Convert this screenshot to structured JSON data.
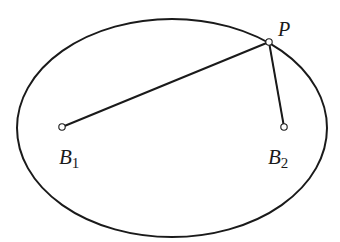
{
  "diagram": {
    "type": "ellipse-with-focal-segments",
    "background": "#ffffff",
    "stroke_color": "#1a1a1a",
    "ellipse": {
      "cx": 172,
      "cy": 128,
      "rx": 155,
      "ry": 109
    },
    "points": [
      {
        "id": "P",
        "x": 269,
        "y": 42,
        "label": "P",
        "subscript": "",
        "label_x": 278,
        "label_y": 36
      },
      {
        "id": "B1",
        "x": 62,
        "y": 127,
        "label": "B",
        "subscript": "1",
        "label_x": 59,
        "label_y": 164
      },
      {
        "id": "B2",
        "x": 284,
        "y": 127,
        "label": "B",
        "subscript": "2",
        "label_x": 268,
        "label_y": 164
      }
    ],
    "segments": [
      {
        "from": "B1",
        "to": "P"
      },
      {
        "from": "P",
        "to": "B2"
      }
    ]
  },
  "labels": {
    "P": "P",
    "B1_main": "B",
    "B1_sub": "1",
    "B2_main": "B",
    "B2_sub": "2"
  }
}
